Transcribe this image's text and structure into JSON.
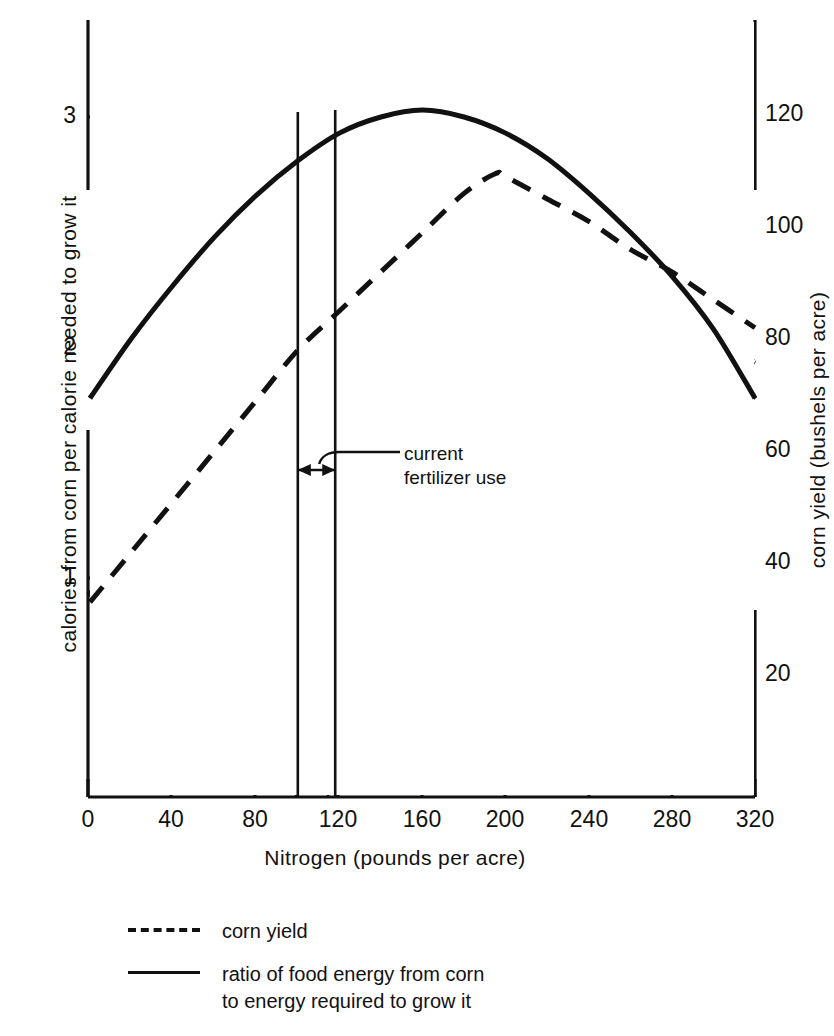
{
  "chart_data": {
    "type": "line",
    "title": "",
    "subtitle": "",
    "xlabel": "Nitrogen (pounds per acre)",
    "ylabel": "calories from corn per calorie needed to grow it",
    "y2label": "corn yield (bushels per acre)",
    "xlim": [
      0,
      320
    ],
    "ylim": [
      0,
      3.3
    ],
    "y2lim": [
      0,
      132
    ],
    "grid": false,
    "legend_position": "below-plot-left",
    "xticks": [
      "0",
      "40",
      "80",
      "120",
      "160",
      "200",
      "240",
      "280",
      "320"
    ],
    "xtick_values": [
      0,
      40,
      80,
      120,
      160,
      200,
      240,
      280,
      320
    ],
    "yticks": [
      "1",
      "2",
      "3"
    ],
    "ytick_values": [
      1,
      2,
      3
    ],
    "y2ticks": [
      "20",
      "40",
      "60",
      "80",
      "100",
      "120"
    ],
    "y2tick_values": [
      20,
      40,
      60,
      80,
      100,
      120
    ],
    "series": [
      {
        "name": "ratio of food energy from corn to energy required to grow it",
        "legend_label": "ratio of food energy from corn to energy required to grow it",
        "style": "solid",
        "axis": "left",
        "x": [
          0,
          20,
          40,
          60,
          80,
          100,
          120,
          140,
          160,
          180,
          200,
          220,
          240,
          260,
          280,
          300,
          320
        ],
        "y": [
          1.78,
          2.04,
          2.27,
          2.48,
          2.66,
          2.81,
          2.93,
          3.0,
          3.03,
          3.0,
          2.93,
          2.82,
          2.67,
          2.5,
          2.31,
          2.08,
          1.78
        ]
      },
      {
        "name": "corn yield",
        "legend_label": "corn yield",
        "style": "dashed",
        "axis": "right",
        "x": [
          0,
          20,
          40,
          60,
          80,
          100,
          120,
          140,
          160,
          180,
          195,
          200,
          220,
          240,
          260,
          280,
          300,
          320
        ],
        "y": [
          33,
          42,
          51,
          60,
          69,
          78,
          85,
          92,
          99,
          106,
          109.5,
          109,
          105,
          101,
          96,
          92,
          87,
          82
        ]
      }
    ],
    "annotations": [
      {
        "name": "current-fertilizer-use",
        "text_line_1": "current",
        "text_line_2": "fertilizer use",
        "x_range": [
          100,
          118
        ],
        "marker": "double-headed-arrow-between-vertical-lines"
      }
    ]
  },
  "axes": {
    "left": {
      "title": "calories from corn per calorie needed to grow it",
      "ticks": [
        {
          "label": "3",
          "value": 3
        },
        {
          "label": "2",
          "value": 2
        },
        {
          "label": "1",
          "value": 1
        }
      ]
    },
    "right": {
      "title": "corn yield (bushels per acre)",
      "ticks": [
        {
          "label": "120",
          "value": 120
        },
        {
          "label": "100",
          "value": 100
        },
        {
          "label": "80",
          "value": 80
        },
        {
          "label": "60",
          "value": 60
        },
        {
          "label": "40",
          "value": 40
        },
        {
          "label": "20",
          "value": 20
        }
      ]
    },
    "bottom": {
      "title": "Nitrogen (pounds per acre)",
      "ticks": [
        {
          "label": "0",
          "value": 0
        },
        {
          "label": "40",
          "value": 40
        },
        {
          "label": "80",
          "value": 80
        },
        {
          "label": "120",
          "value": 120
        },
        {
          "label": "160",
          "value": 160
        },
        {
          "label": "200",
          "value": 200
        },
        {
          "label": "240",
          "value": 240
        },
        {
          "label": "280",
          "value": 280
        },
        {
          "label": "320",
          "value": 320
        }
      ]
    }
  },
  "annotation": {
    "line1": "current",
    "line2": "fertilizer use"
  },
  "legend": {
    "items": [
      {
        "style": "dashed",
        "label": "corn yield"
      },
      {
        "style": "solid",
        "label": "ratio of food energy from corn\nto energy required to grow it"
      }
    ],
    "item0_label": "corn yield",
    "item1_label_line1": "ratio of food energy from corn",
    "item1_label_line2": "to energy required to grow it"
  },
  "colors": {
    "ink": "#111111",
    "background": "#ffffff"
  }
}
